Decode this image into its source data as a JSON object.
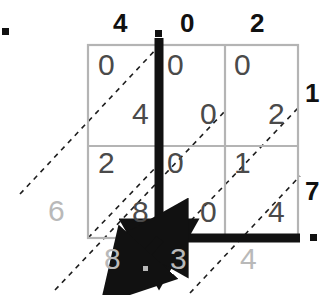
{
  "diagram": {
    "colors": {
      "ink": "#111111",
      "cell_digit": "#4a4a4a",
      "result_digit": "#b9b9b9",
      "grid_line": "#b0b0b0",
      "dash_line": "#222222"
    }
  },
  "top_labels": [
    {
      "text": "4",
      "x": 113,
      "y": 10
    },
    {
      "text": ".",
      "x": 150,
      "y": 10
    },
    {
      "text": "0",
      "x": 180,
      "y": 10
    },
    {
      "text": "2",
      "x": 250,
      "y": 10
    }
  ],
  "top_decimal_dot": {
    "x": 155,
    "y": 30
  },
  "corner_dot": {
    "x": 2,
    "y": 28
  },
  "right_labels": [
    {
      "text": "1",
      "x": 305,
      "y": 80
    },
    {
      "text": "7",
      "x": 305,
      "y": 178
    }
  ],
  "right_decimal_dot": {
    "x": 310,
    "y": 234
  },
  "grid": {
    "left": 88,
    "top": 45,
    "right": 298,
    "bottom": 238,
    "col_x": [
      88,
      158,
      225,
      298
    ],
    "row_y": [
      45,
      146,
      238
    ],
    "rows": [
      {
        "multiplier": "1",
        "cells": [
          {
            "upper": "0",
            "lower": "4"
          },
          {
            "upper": "0",
            "lower": "0"
          },
          {
            "upper": "0",
            "lower": "2"
          }
        ]
      },
      {
        "multiplier": "7",
        "cells": [
          {
            "upper": "2",
            "lower": "8"
          },
          {
            "upper": "0",
            "lower": "0"
          },
          {
            "upper": "1",
            "lower": "4"
          }
        ]
      }
    ]
  },
  "left_result": [
    {
      "text": "6",
      "x": 48,
      "y": 196
    }
  ],
  "bottom_result": [
    {
      "text": "8",
      "x": 104,
      "y": 244
    },
    {
      "text": "3",
      "x": 170,
      "y": 244
    },
    {
      "text": "4",
      "x": 240,
      "y": 244
    }
  ],
  "bottom_decimal_dot": {
    "x": 143,
    "y": 266
  },
  "arrows": {
    "vertical": {
      "x": 159,
      "y1": 38,
      "y2": 238,
      "label": "down-arrow-to-junction"
    },
    "horizontal": {
      "y": 238,
      "x1": 300,
      "x2": 166,
      "label": "left-arrow-to-junction"
    },
    "diagonal": {
      "x1": 160,
      "y1": 239,
      "x2": 134,
      "y2": 267,
      "label": "diagonal-arrow-out"
    }
  },
  "answer": {
    "multiplicand": "4.02",
    "multiplier": "17",
    "product": "68.34"
  }
}
